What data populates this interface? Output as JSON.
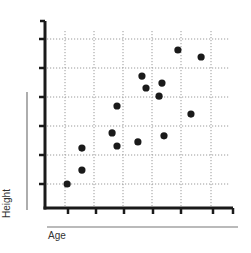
{
  "chart_data": {
    "type": "scatter",
    "title": "",
    "xlabel": "Age",
    "ylabel": "Height",
    "xlim": [
      0.2,
      6.7
    ],
    "ylim": [
      0.2,
      6.6
    ],
    "x_ticks": [
      1,
      2,
      3,
      4,
      5,
      6
    ],
    "y_ticks": [
      1,
      2,
      3,
      4,
      5,
      6
    ],
    "tick_labels_shown": false,
    "grid": true,
    "grid_style": "dotted",
    "legend": null,
    "marker_color": "#1a1a1a",
    "points": [
      {
        "x": 0.97,
        "y": 1.0
      },
      {
        "x": 1.48,
        "y": 1.48
      },
      {
        "x": 1.48,
        "y": 2.24
      },
      {
        "x": 2.52,
        "y": 2.76
      },
      {
        "x": 2.69,
        "y": 3.69
      },
      {
        "x": 2.69,
        "y": 2.31
      },
      {
        "x": 3.41,
        "y": 2.45
      },
      {
        "x": 3.55,
        "y": 4.72
      },
      {
        "x": 3.69,
        "y": 4.31
      },
      {
        "x": 4.14,
        "y": 4.03
      },
      {
        "x": 4.24,
        "y": 4.48
      },
      {
        "x": 4.31,
        "y": 2.66
      },
      {
        "x": 4.79,
        "y": 5.62
      },
      {
        "x": 5.24,
        "y": 3.41
      },
      {
        "x": 5.59,
        "y": 5.38
      }
    ]
  },
  "labels": {
    "x_axis": "Age",
    "y_axis": "Height"
  }
}
